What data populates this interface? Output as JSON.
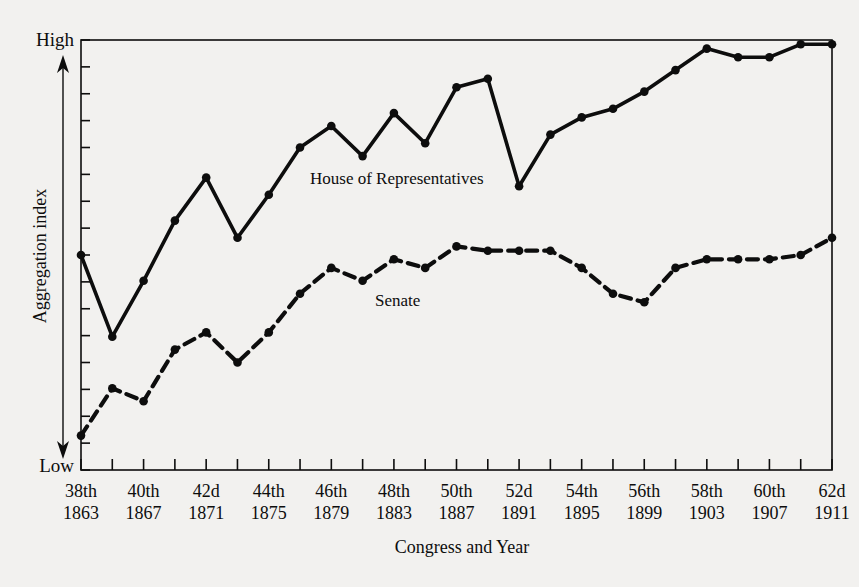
{
  "figure": {
    "background_color": "#f2f1ef",
    "ink_color": "#0d0d0d"
  },
  "axes": {
    "y_axis": {
      "label": "Aggregation index",
      "high_label": "High",
      "low_label": "Low",
      "tick_count": 16,
      "arrow": "double-headed-vertical-arrow"
    },
    "x_axis": {
      "title": "Congress and Year",
      "tick_count": 25,
      "labels": [
        {
          "congress": "38th",
          "year": "1863"
        },
        {
          "congress": "40th",
          "year": "1867"
        },
        {
          "congress": "42d",
          "year": "1871"
        },
        {
          "congress": "44th",
          "year": "1875"
        },
        {
          "congress": "46th",
          "year": "1879"
        },
        {
          "congress": "48th",
          "year": "1883"
        },
        {
          "congress": "50th",
          "year": "1887"
        },
        {
          "congress": "52d",
          "year": "1891"
        },
        {
          "congress": "54th",
          "year": "1895"
        },
        {
          "congress": "56th",
          "year": "1899"
        },
        {
          "congress": "58th",
          "year": "1903"
        },
        {
          "congress": "60th",
          "year": "1907"
        },
        {
          "congress": "62d",
          "year": "1911"
        }
      ]
    }
  },
  "annotations": [
    {
      "name": "house-series-label",
      "text": "House of Representatives",
      "x": 310,
      "y": 184
    },
    {
      "name": "senate-series-label",
      "text": "Senate",
      "x": 375,
      "y": 306
    }
  ],
  "chart_data": {
    "type": "line",
    "title": "",
    "xlabel": "Congress and Year",
    "ylabel": "Aggregation index",
    "ylim": [
      0,
      100
    ],
    "ylim_labels": [
      "Low",
      "High"
    ],
    "grid": false,
    "legend": "inline-labels",
    "x": [
      "38th 1863",
      "39th 1865",
      "40th 1867",
      "41st 1869",
      "42d 1871",
      "43d 1873",
      "44th 1875",
      "45th 1877",
      "46th 1879",
      "47th 1881",
      "48th 1883",
      "49th 1885",
      "50th 1887",
      "51st 1889",
      "52d 1891",
      "53d 1893",
      "54th 1895",
      "55th 1897",
      "56th 1899",
      "57th 1901",
      "58th 1903",
      "59th 1905",
      "60th 1907",
      "61st 1909",
      "62d 1911"
    ],
    "series": [
      {
        "name": "House of Representatives",
        "style": "solid",
        "marker": "filled-circle",
        "values": [
          50,
          31,
          44,
          58,
          68,
          54,
          64,
          75,
          80,
          73,
          83,
          76,
          89,
          91,
          66,
          78,
          82,
          84,
          88,
          93,
          98,
          96,
          96,
          99,
          99
        ]
      },
      {
        "name": "Senate",
        "style": "dashed",
        "marker": "filled-circle",
        "values": [
          8,
          19,
          16,
          28,
          32,
          25,
          32,
          41,
          47,
          44,
          49,
          47,
          52,
          51,
          51,
          51,
          47,
          41,
          39,
          47,
          49,
          49,
          49,
          50,
          54
        ]
      }
    ]
  }
}
